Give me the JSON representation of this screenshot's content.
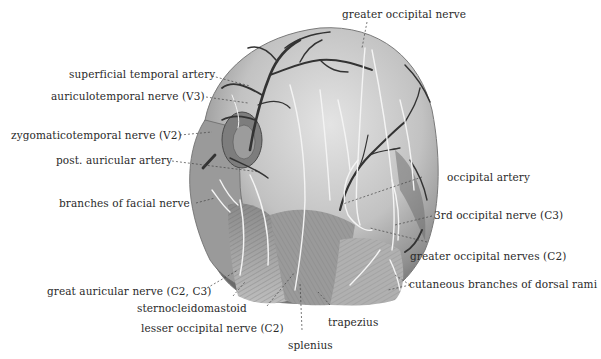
{
  "figure": {
    "colors": {
      "background": "#ffffff",
      "skin_light": "#d9d9d9",
      "skin_mid": "#a8a8a8",
      "skin_dark": "#5c5c5c",
      "artery": "#3a3a3a",
      "nerve": "#f2f2f2",
      "label_text": "#2a2a2a",
      "leader_line": "#444444"
    },
    "labels": {
      "greater_occipital_nerve": "greater occipital nerve",
      "superficial_temporal_artery": "superficial temporal artery",
      "auriculotemporal_nerve": "auriculotemporal nerve (V3)",
      "zygomaticotemporal_nerve": "zygomaticotemporal nerve (V2)",
      "post_auricular_artery": "post. auricular artery",
      "branches_facial_nerve": "branches of facial nerve",
      "occipital_artery": "occipital artery",
      "third_occipital_nerve": "3rd occipital nerve (C3)",
      "greater_occipital_nerves": "greater occipital nerves (C2)",
      "cutaneous_branches": "cutaneous branches of dorsal rami",
      "great_auricular_nerve": "great auricular nerve (C2, C3)",
      "sternocleidomastoid": "sternocleidomastoid",
      "lesser_occipital_nerve": "lesser occipital nerve (C2)",
      "trapezius": "trapezius",
      "splenius": "splenius"
    }
  }
}
